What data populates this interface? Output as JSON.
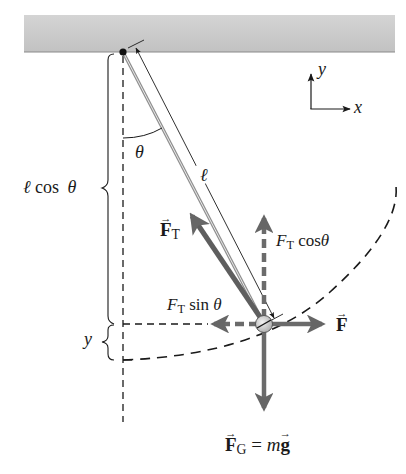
{
  "figure": {
    "type": "pendulum-free-body-diagram",
    "colors": {
      "ceiling": "#c9c9c9",
      "ceiling_edge": "#8a8a8a",
      "line": "#1a1a1a",
      "force_arrow": "#6b6b6b",
      "string": "#9a9a9a",
      "bob": "#d9d9d9"
    }
  },
  "axes": {
    "y_label": "y",
    "x_label": "x"
  },
  "labels": {
    "theta": "θ",
    "length": "ℓ",
    "l_cos_theta": {
      "ell": "ℓ",
      "cos": "cos",
      "theta": "θ"
    },
    "y_height": "y",
    "tension": {
      "symbol": "F",
      "subscript": "T"
    },
    "tension_cos": {
      "symbol": "F",
      "subscript": "T",
      "func": "cos",
      "theta": "θ"
    },
    "tension_sin": {
      "symbol": "F",
      "subscript": "T",
      "func": "sin",
      "theta": "θ"
    },
    "applied_force": {
      "symbol": "F"
    },
    "gravity": {
      "symbol": "F",
      "subscript": "G",
      "equals": "=",
      "m": "m",
      "g": "g"
    }
  }
}
